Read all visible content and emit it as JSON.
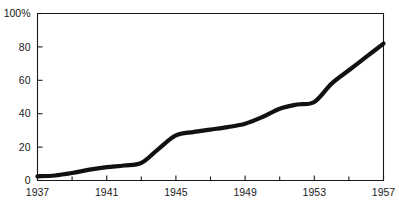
{
  "chart_data": {
    "type": "line",
    "title": "",
    "subtitle": "",
    "xlabel": "",
    "ylabel": "",
    "xlim": [
      1937,
      1957
    ],
    "ylim": [
      0,
      100
    ],
    "grid": false,
    "legend": null,
    "y_tick_labels": [
      "0",
      "20",
      "40",
      "60",
      "80",
      "100%"
    ],
    "y_tick_values": [
      0,
      20,
      40,
      60,
      80,
      100
    ],
    "x_tick_labels": [
      "1937",
      "1941",
      "1945",
      "1949",
      "1953",
      "1957"
    ],
    "x_tick_values": [
      1937,
      1941,
      1945,
      1949,
      1953,
      1957
    ],
    "x_minor_tick_values": [
      1939,
      1943,
      1947,
      1951,
      1955
    ],
    "line_color": "#111111",
    "axis_color": "#1a1a1a",
    "series": [
      {
        "name": "percent",
        "x": [
          1937,
          1938,
          1939,
          1940,
          1941,
          1942,
          1943,
          1944,
          1945,
          1946,
          1947,
          1948,
          1949,
          1950,
          1951,
          1952,
          1953,
          1954,
          1955,
          1956,
          1957
        ],
        "values": [
          2.5,
          3,
          4.5,
          6.5,
          8,
          9,
          10.5,
          19,
          27,
          29,
          30.5,
          32,
          34,
          38,
          43,
          45.5,
          47,
          58,
          66,
          74,
          82
        ]
      }
    ]
  },
  "axes": {
    "y_unit_suffix": "%"
  }
}
